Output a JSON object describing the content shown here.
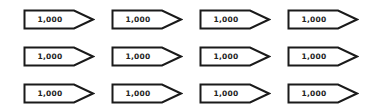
{
  "colors": {
    "stroke": "#1a1a1a",
    "fill": "#ffffff",
    "text": "#222222"
  },
  "grid": {
    "columns_x": [
      23,
      111,
      199,
      287
    ],
    "rows_y": [
      9,
      46,
      83
    ]
  },
  "tags": [
    [
      {
        "label": "1,000"
      },
      {
        "label": "1,000"
      },
      {
        "label": "1,000"
      },
      {
        "label": "1,000"
      }
    ],
    [
      {
        "label": "1,000"
      },
      {
        "label": "1,000"
      },
      {
        "label": "1,000"
      },
      {
        "label": "1,000"
      }
    ],
    [
      {
        "label": "1,000"
      },
      {
        "label": "1,000"
      },
      {
        "label": "1,000"
      },
      {
        "label": "1,000"
      }
    ]
  ]
}
